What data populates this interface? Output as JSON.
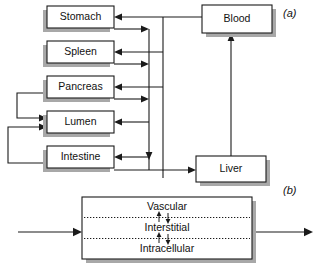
{
  "figure": {
    "panels": [
      {
        "id": "a",
        "label": "(a)"
      },
      {
        "id": "b",
        "label": "(b)"
      }
    ]
  },
  "panel_a": {
    "label": "(a)",
    "boxes": [
      {
        "id": "stomach",
        "label": "Stomach",
        "x": 47,
        "y": 6,
        "w": 67,
        "h": 22
      },
      {
        "id": "spleen",
        "label": "Spleen",
        "x": 47,
        "y": 41,
        "w": 67,
        "h": 22
      },
      {
        "id": "pancreas",
        "label": "Pancreas",
        "x": 47,
        "y": 76,
        "w": 67,
        "h": 22
      },
      {
        "id": "lumen",
        "label": "Lumen",
        "x": 47,
        "y": 111,
        "w": 67,
        "h": 22
      },
      {
        "id": "intestine",
        "label": "Intestine",
        "x": 47,
        "y": 146,
        "w": 67,
        "h": 22
      },
      {
        "id": "blood",
        "label": "Blood",
        "x": 202,
        "y": 5,
        "w": 70,
        "h": 28
      },
      {
        "id": "liver",
        "label": "Liver",
        "x": 196,
        "y": 156,
        "w": 70,
        "h": 26
      }
    ],
    "flows": [
      {
        "from": "blood",
        "to": "stomach"
      },
      {
        "from": "blood",
        "to": "spleen"
      },
      {
        "from": "blood",
        "to": "pancreas"
      },
      {
        "from": "blood",
        "to": "lumen"
      },
      {
        "from": "blood",
        "to": "intestine"
      },
      {
        "from": "stomach",
        "to": "liver"
      },
      {
        "from": "spleen",
        "to": "liver"
      },
      {
        "from": "pancreas",
        "to": "liver"
      },
      {
        "from": "intestine",
        "to": "liver"
      },
      {
        "from": "liver",
        "to": "blood"
      },
      {
        "from": "pancreas",
        "to": "lumen"
      },
      {
        "from": "intestine",
        "to": "lumen"
      }
    ]
  },
  "panel_b": {
    "label": "(b)",
    "box": {
      "x": 82,
      "y": 197,
      "w": 170,
      "h": 62
    },
    "compartments": [
      {
        "id": "vascular",
        "label": "Vascular"
      },
      {
        "id": "interstitial",
        "label": "Interstitial"
      },
      {
        "id": "intracellular",
        "label": "Intracellular"
      }
    ],
    "input_arrow": {
      "label": ""
    },
    "output_arrow": {
      "label": ""
    }
  }
}
